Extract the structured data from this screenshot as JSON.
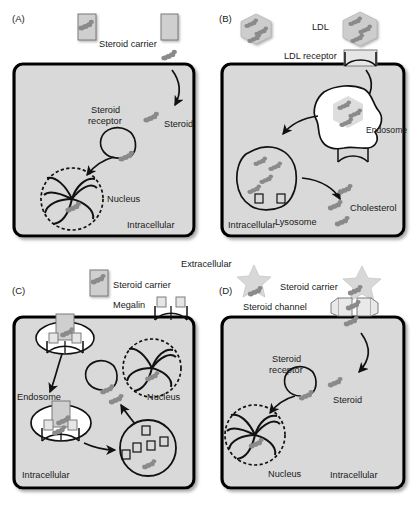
{
  "figure": {
    "extracellular_label": "Extracellular",
    "colors": {
      "cell_fill": "#d9d9d9",
      "cell_border": "#000000",
      "molecule": "#8a8a8a",
      "carrier_fill": "#cfcfcf",
      "ldl_fill": "#cdcdcd",
      "vesicle_fill": "#ffffff",
      "text": "#1a1a1a"
    }
  },
  "panels": [
    {
      "id": "(A)",
      "name": "free-diffusion",
      "labels": {
        "carrier": "Steroid carrier",
        "receptor": "Steroid\nreceptor",
        "receptor_line1": "Steroid",
        "receptor_line2": "receptor",
        "steroid": "Steroid",
        "nucleus": "Nucleus",
        "intracellular": "Intracellular"
      }
    },
    {
      "id": "(B)",
      "name": "ldl-receptor-endocytosis",
      "labels": {
        "ldl": "LDL",
        "ldl_receptor": "LDL receptor",
        "endosome": "Endosome",
        "lysosome": "Lysosome",
        "cholesterol": "Cholesterol",
        "intracellular": "Intracellular"
      }
    },
    {
      "id": "(C)",
      "name": "megalin-endocytosis",
      "labels": {
        "carrier": "Steroid carrier",
        "megalin": "Megalin",
        "endosome": "Endosome",
        "nucleus": "Nucleus",
        "intracellular": "Intracellular"
      }
    },
    {
      "id": "(D)",
      "name": "steroid-channel-transport",
      "labels": {
        "carrier": "Steroid carrier",
        "channel": "Steroid channel",
        "receptor_line1": "Steroid",
        "receptor_line2": "receptor",
        "steroid": "Steroid",
        "nucleus": "Nucleus",
        "intracellular": "Intracellular"
      }
    }
  ]
}
